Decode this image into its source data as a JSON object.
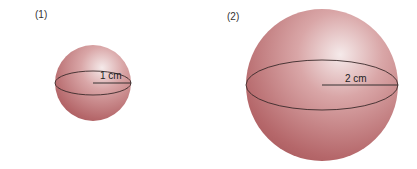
{
  "figures": [
    {
      "label": "(1)",
      "radius_label": "1 cm",
      "cx": 93,
      "cy": 83,
      "r": 38
    },
    {
      "label": "(2)",
      "radius_label": "2 cm",
      "cx": 322,
      "cy": 85,
      "r": 76
    }
  ],
  "colors": {
    "sphere_base": "#b8696c",
    "sphere_highlight": "#f3e6e6",
    "outline": "#3a2a2a"
  }
}
